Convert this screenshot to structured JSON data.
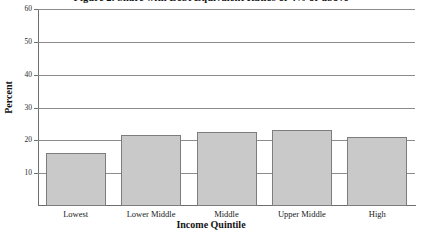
{
  "chart_data": {
    "type": "bar",
    "title": "Figure 2. Share with Debt Equivalent Ratios of 4% or above",
    "xlabel": "Income Quintile",
    "ylabel": "Percent",
    "categories": [
      "Lowest",
      "Lower Middle",
      "Middle",
      "Upper Middle",
      "High"
    ],
    "values": [
      16,
      21.5,
      22.5,
      23,
      21
    ],
    "ylim": [
      0,
      60
    ],
    "yticks": [
      10,
      20,
      30,
      40,
      50,
      60
    ],
    "ytick_labels": [
      "10",
      "20",
      "30",
      "40",
      "50",
      "60"
    ],
    "grid": true,
    "legend": false,
    "bar_color": "#c9c9c9",
    "bar_border_color": "#7d7d7d",
    "gridline_color": "#8c8c8c",
    "axis_color": "#6e6e6e"
  }
}
